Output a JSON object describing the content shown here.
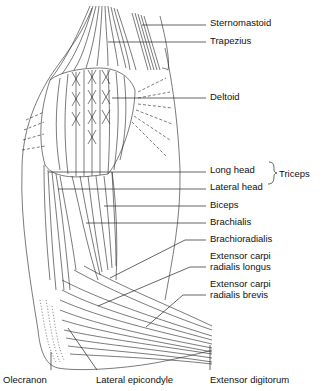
{
  "figure": {
    "labels": [
      {
        "id": "sternomastoid",
        "text": "Sternomastoid",
        "x": 210,
        "y": 17
      },
      {
        "id": "trapezius",
        "text": "Trapezius",
        "x": 210,
        "y": 35
      },
      {
        "id": "deltoid",
        "text": "Deltoid",
        "x": 210,
        "y": 91
      },
      {
        "id": "long-head",
        "text": "Long head",
        "x": 210,
        "y": 162
      },
      {
        "id": "lateral-head",
        "text": "Lateral head",
        "x": 210,
        "y": 179
      },
      {
        "id": "biceps",
        "text": "Biceps",
        "x": 210,
        "y": 198
      },
      {
        "id": "brachialis",
        "text": "Brachialis",
        "x": 210,
        "y": 216
      },
      {
        "id": "brachioradialis",
        "text": "Brachioradialis",
        "x": 210,
        "y": 234
      },
      {
        "id": "ecrl",
        "text": "Extensor carpi\nradialis longus",
        "x": 210,
        "y": 250
      },
      {
        "id": "ecrb",
        "text": "Extensor carpi\nradialis brevis",
        "x": 210,
        "y": 277
      },
      {
        "id": "olecranon",
        "text": "Olecranon",
        "x": 3,
        "y": 374
      },
      {
        "id": "lateral-epicondyle",
        "text": "Lateral epicondyle",
        "x": 96,
        "y": 374
      },
      {
        "id": "extensor-digitorum",
        "text": "Extensor digitorum",
        "x": 210,
        "y": 374
      }
    ],
    "group_label": {
      "id": "triceps",
      "text": "Triceps",
      "x": 277,
      "y": 170
    },
    "colors": {
      "line": "#111111",
      "background": "#ffffff"
    }
  }
}
